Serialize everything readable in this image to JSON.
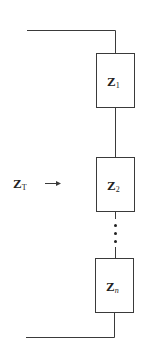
{
  "diagram": {
    "type": "series-impedance-circuit",
    "input_label": {
      "main": "Z",
      "sub": "T"
    },
    "arrow": "right-arrow",
    "elements": [
      {
        "main": "Z",
        "sub": "1"
      },
      {
        "main": "Z",
        "sub": "2"
      },
      {
        "main": "Z",
        "sub": "n"
      }
    ],
    "ellipsis": "vertical-dots",
    "colors": {
      "line": "#3a3a3a",
      "text": "#222222",
      "background": "#ffffff"
    }
  }
}
